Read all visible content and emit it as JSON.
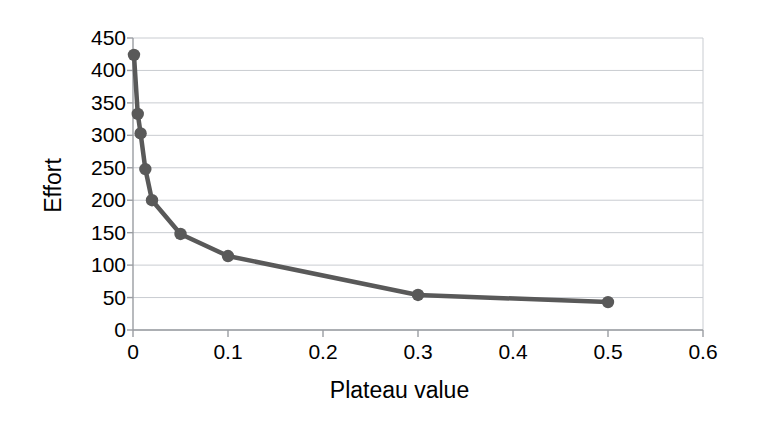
{
  "chart_data": {
    "type": "line",
    "title": "",
    "xlabel": "Plateau value",
    "ylabel": "Effort",
    "xlim": [
      0,
      0.6
    ],
    "ylim": [
      0,
      450
    ],
    "grid": true,
    "legend": "none",
    "marker": "circle",
    "series_color": "#595959",
    "x_ticks": [
      "0",
      "0.1",
      "0.2",
      "0.3",
      "0.4",
      "0.5",
      "0.6"
    ],
    "x_tick_values": [
      0,
      0.1,
      0.2,
      0.3,
      0.4,
      0.5,
      0.6
    ],
    "y_ticks": [
      "0",
      "50",
      "100",
      "150",
      "200",
      "250",
      "300",
      "350",
      "400",
      "450"
    ],
    "y_tick_values": [
      0,
      50,
      100,
      150,
      200,
      250,
      300,
      350,
      400,
      450
    ],
    "series": [
      {
        "name": "Effort",
        "x": [
          0.001,
          0.005,
          0.008,
          0.013,
          0.02,
          0.05,
          0.1,
          0.3,
          0.5
        ],
        "values": [
          424,
          333,
          303,
          248,
          200,
          148,
          114,
          54,
          43
        ]
      }
    ]
  }
}
